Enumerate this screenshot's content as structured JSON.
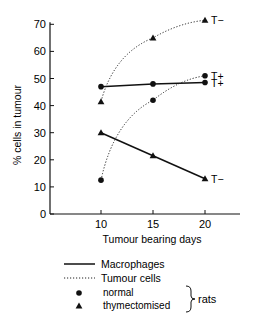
{
  "chart_data": {
    "type": "line",
    "title": "",
    "xlabel": "Tumour bearing days",
    "ylabel": "% cells in tumour",
    "x": [
      10,
      15,
      20
    ],
    "xticks": [
      "10",
      "15",
      "20"
    ],
    "yticks": [
      "0",
      "10",
      "20",
      "30",
      "40",
      "50",
      "60",
      "70"
    ],
    "xlim": [
      5,
      23
    ],
    "ylim": [
      0,
      75
    ],
    "grid": false,
    "series": [
      {
        "name": "Macrophages - normal rats",
        "line": "solid",
        "marker": "circle",
        "values": [
          47,
          48,
          48.5
        ],
        "end_label": "T+"
      },
      {
        "name": "Macrophages - thymectomised rats",
        "line": "solid",
        "marker": "triangle",
        "values": [
          30,
          21.5,
          13
        ],
        "end_label": "T−"
      },
      {
        "name": "Tumour cells - normal rats",
        "line": "dotted",
        "marker": "circle",
        "values": [
          12.5,
          42,
          51
        ],
        "end_label": "T+"
      },
      {
        "name": "Tumour cells - thymectomised rats",
        "line": "dotted",
        "marker": "triangle",
        "values": [
          41.5,
          65,
          71.5
        ],
        "end_label": "T−"
      }
    ],
    "legend": {
      "position": "bottom",
      "lines": [
        {
          "style": "solid",
          "label": "Macrophages"
        },
        {
          "style": "dotted",
          "label": "Tumour cells"
        }
      ],
      "markers": [
        {
          "marker": "circle",
          "label": "normal"
        },
        {
          "marker": "triangle",
          "label": "thymectomised"
        }
      ],
      "group_label": "rats"
    }
  }
}
